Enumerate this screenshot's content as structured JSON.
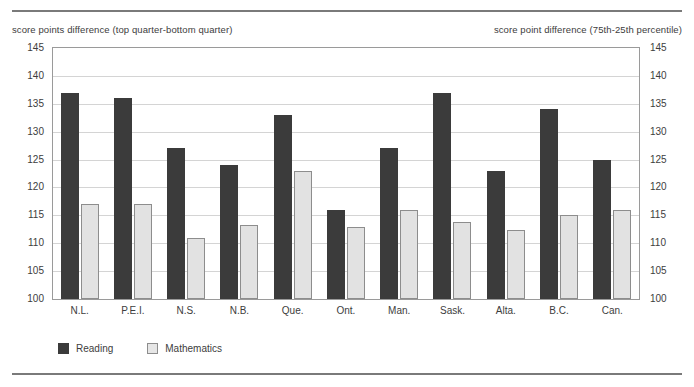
{
  "header": {
    "left_caption": "score points difference (top quarter-bottom quarter)",
    "right_caption": "score point difference (75th-25th percentile)"
  },
  "legend": {
    "items": [
      {
        "label": "Reading",
        "color": "#3b3b3b",
        "swatch": "reading-swatch"
      },
      {
        "label": "Mathematics",
        "color": "#e6e6e6",
        "swatch": "mathematics-swatch"
      }
    ]
  },
  "chart_data": {
    "type": "bar",
    "title": "",
    "xlabel": "",
    "ylabel": "score points difference (top quarter-bottom quarter)",
    "ylabel_right": "score point difference (75th-25th percentile)",
    "ylim": [
      100,
      145
    ],
    "yticks": [
      100,
      105,
      110,
      115,
      120,
      125,
      130,
      135,
      140,
      145
    ],
    "grid": true,
    "legend_position": "bottom-left",
    "categories": [
      "N.L.",
      "P.E.I.",
      "N.S.",
      "N.B.",
      "Que.",
      "Ont.",
      "Man.",
      "Sask.",
      "Alta.",
      "B.C.",
      "Can."
    ],
    "series": [
      {
        "name": "Reading",
        "color": "#3b3b3b",
        "values": [
          137,
          136,
          127,
          124,
          133,
          116,
          127,
          137,
          123,
          134,
          125
        ]
      },
      {
        "name": "Mathematics",
        "color": "#e6e6e6",
        "values": [
          117,
          117,
          111,
          113.3,
          123,
          113,
          116,
          113.8,
          112.3,
          115,
          116
        ]
      }
    ]
  }
}
